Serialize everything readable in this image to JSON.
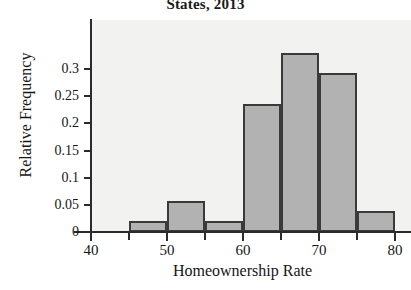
{
  "chart_data": {
    "type": "bar",
    "title": "States, 2013",
    "subtitle": "",
    "xlabel": "Homeownership Rate",
    "ylabel": "Relative Frequency",
    "xlim": [
      40,
      80
    ],
    "ylim": [
      0,
      0.35
    ],
    "grid": false,
    "legend": null,
    "bin_width": 5,
    "bar_fill_color": "#b2b2b2",
    "bar_edge_color": "#3a3a3a",
    "plot_background_color": "#f2f2f0",
    "axis_color": "#2b2b2b",
    "bin_edges": [
      45,
      50,
      55,
      60,
      65,
      70,
      75,
      80
    ],
    "categories": [
      "45-50",
      "50-55",
      "55-60",
      "60-65",
      "65-70",
      "70-75",
      "75-80"
    ],
    "values": [
      0.02,
      0.057,
      0.02,
      0.235,
      0.33,
      0.293,
      0.039
    ],
    "x_ticks": [
      {
        "value": 40,
        "label": "40",
        "major": true
      },
      {
        "value": 45,
        "label": "",
        "major": false
      },
      {
        "value": 50,
        "label": "50",
        "major": true
      },
      {
        "value": 55,
        "label": "",
        "major": false
      },
      {
        "value": 60,
        "label": "60",
        "major": true
      },
      {
        "value": 65,
        "label": "",
        "major": false
      },
      {
        "value": 70,
        "label": "70",
        "major": true
      },
      {
        "value": 75,
        "label": "",
        "major": false
      },
      {
        "value": 80,
        "label": "80",
        "major": true
      }
    ],
    "y_ticks": [
      {
        "value": 0,
        "label": "0"
      },
      {
        "value": 0.05,
        "label": "0.05"
      },
      {
        "value": 0.1,
        "label": "0.1"
      },
      {
        "value": 0.15,
        "label": "0.15"
      },
      {
        "value": 0.2,
        "label": "0.2"
      },
      {
        "value": 0.25,
        "label": "0.25"
      },
      {
        "value": 0.3,
        "label": "0.3"
      }
    ]
  }
}
